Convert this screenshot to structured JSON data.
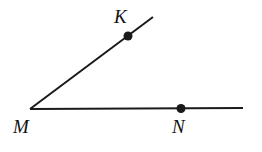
{
  "diagram": {
    "type": "angle",
    "vertex": {
      "label": "M",
      "x": 30,
      "y": 109
    },
    "rays": [
      {
        "name": "MK",
        "from": "M",
        "to": {
          "x": 153,
          "y": 17
        }
      },
      {
        "name": "MN",
        "from": "M",
        "to": {
          "x": 243,
          "y": 108
        }
      }
    ],
    "points": [
      {
        "label": "K",
        "x": 128,
        "y": 36
      },
      {
        "label": "N",
        "x": 181,
        "y": 108.5
      }
    ],
    "labels": {
      "K": "K",
      "M": "M",
      "N": "N"
    },
    "colors": {
      "stroke": "#1a1a1a",
      "background": "#ffffff"
    }
  }
}
